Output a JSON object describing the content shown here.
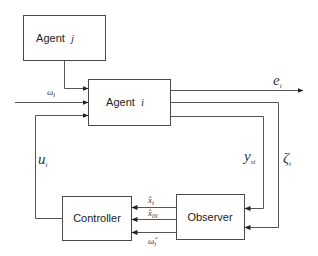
{
  "diagram": {
    "type": "block-diagram",
    "title": "",
    "colors": {
      "stroke": "#4a4a4a",
      "wire": "#555555",
      "text": "#222222",
      "background": "#ffffff"
    },
    "blocks": {
      "agent_j": {
        "name": "Agent",
        "index": "j"
      },
      "agent_i": {
        "name": "Agent",
        "index": "i"
      },
      "controller": {
        "label": "Controller"
      },
      "observer": {
        "label": "Observer"
      }
    },
    "signals": {
      "omega": {
        "base": "ω",
        "sub": "i"
      },
      "e": {
        "base": "e",
        "sub": "i"
      },
      "y": {
        "base": "y",
        "sub": "si"
      },
      "zeta": {
        "base": "ζ",
        "sub": "i"
      },
      "u": {
        "base": "u",
        "sub": "i"
      },
      "xhat": {
        "base": "x̂",
        "sub": "i"
      },
      "x0hat": {
        "base": "x̂",
        "sub": "0i"
      },
      "omegahat": {
        "base": "ω̂",
        "sub": "i"
      }
    },
    "edges": [
      {
        "from": "agent_j",
        "to": "agent_i"
      },
      {
        "from": "external",
        "to": "agent_i",
        "label": "ω_i"
      },
      {
        "from": "controller",
        "to": "agent_i",
        "label": "u_i"
      },
      {
        "from": "agent_i",
        "to": "output",
        "label": "e_i"
      },
      {
        "from": "agent_i",
        "to": "observer",
        "label": "y_si"
      },
      {
        "from": "agent_i",
        "to": "observer",
        "label": "ζ_i"
      },
      {
        "from": "observer",
        "to": "controller",
        "label": "x̂_i"
      },
      {
        "from": "observer",
        "to": "controller",
        "label": "x̂_0i"
      },
      {
        "from": "observer",
        "to": "controller",
        "label": "ω̂_i"
      }
    ]
  }
}
